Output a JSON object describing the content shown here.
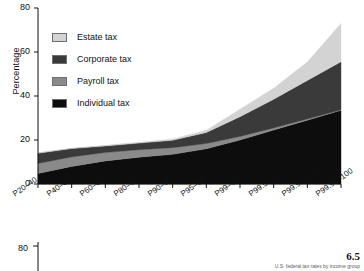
{
  "figure": {
    "number": "6.5",
    "caption_sliver": "U.S. federal tax rates by income group"
  },
  "chart_data": {
    "type": "area",
    "stacked": true,
    "title": "",
    "xlabel": "",
    "ylabel": "Percentage",
    "ylim": [
      0,
      80
    ],
    "yticks": [
      0,
      20,
      40,
      60,
      80
    ],
    "grid": false,
    "legend_position": "upper-left",
    "categories": [
      "P20–40",
      "P40–60",
      "P60–80",
      "P80–90",
      "P90–95",
      "P95–99",
      "P99–99.5",
      "P99.5–99.9",
      "P99.9–99.99",
      "P99.99–100"
    ],
    "series": [
      {
        "name": "Individual tax",
        "color": "#0d0d0d",
        "values": [
          4.8,
          8.0,
          10.5,
          12.2,
          13.5,
          16.0,
          20.0,
          24.5,
          29.0,
          33.5
        ]
      },
      {
        "name": "Payroll tax",
        "color": "#8a8a8a",
        "values": [
          4.5,
          4.3,
          3.8,
          3.4,
          3.0,
          2.4,
          1.6,
          1.0,
          0.6,
          0.3
        ]
      },
      {
        "name": "Corporate tax",
        "color": "#3a3a3a",
        "values": [
          4.7,
          3.8,
          3.0,
          3.0,
          3.4,
          5.0,
          9.0,
          13.0,
          17.5,
          21.8
        ]
      },
      {
        "name": "Estate tax",
        "color": "#d3d3d3",
        "values": [
          0.2,
          0.2,
          0.3,
          0.4,
          0.6,
          1.0,
          3.4,
          5.0,
          8.4,
          17.4
        ]
      }
    ],
    "totals": [
      14.2,
      16.3,
      17.6,
      19.0,
      20.5,
      24.4,
      34.0,
      43.5,
      55.5,
      73.0
    ]
  },
  "legend": {
    "items": [
      {
        "label": "Estate tax"
      },
      {
        "label": "Corporate tax"
      },
      {
        "label": "Payroll tax"
      },
      {
        "label": "Individual tax"
      }
    ]
  },
  "panel2": {
    "ytick_top": "80"
  }
}
